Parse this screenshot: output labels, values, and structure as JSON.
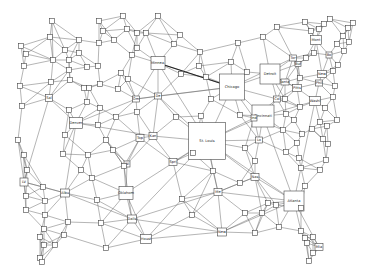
{
  "diagram": {
    "type": "network-graph",
    "labeled_nodes": [
      {
        "id": "stlouis",
        "label": "St. Louis",
        "x": 207,
        "y": 141,
        "w": 37,
        "h": 37
      },
      {
        "id": "chicago",
        "label": "Chicago",
        "x": 232,
        "y": 87,
        "w": 25,
        "h": 26
      },
      {
        "id": "detroit",
        "label": "Detroit",
        "x": 270,
        "y": 74,
        "w": 20,
        "h": 20
      },
      {
        "id": "cincinnati",
        "label": "Cincinnati",
        "x": 263,
        "y": 116,
        "w": 22,
        "h": 22
      },
      {
        "id": "atlanta",
        "label": "Atlanta",
        "x": 294,
        "y": 201,
        "w": 20,
        "h": 20
      },
      {
        "id": "minnea",
        "label": "Minnea.",
        "x": 158,
        "y": 63,
        "w": 14,
        "h": 13
      },
      {
        "id": "denver",
        "label": "Denver",
        "x": 76,
        "y": 123,
        "w": 13,
        "h": 11
      },
      {
        "id": "oklahom",
        "label": "Oklahom",
        "x": 126,
        "y": 193,
        "w": 14,
        "h": 13
      },
      {
        "id": "dallas",
        "label": "Dalls",
        "x": 132,
        "y": 219,
        "w": 9,
        "h": 8
      },
      {
        "id": "houst",
        "label": "Houst",
        "x": 146,
        "y": 239,
        "w": 11,
        "h": 9
      },
      {
        "id": "albu",
        "label": "Albu",
        "x": 65,
        "y": 193,
        "w": 9,
        "h": 8
      },
      {
        "id": "lv",
        "label": "LV",
        "x": 24,
        "y": 182,
        "w": 8,
        "h": 8
      },
      {
        "id": "sal",
        "label": "Sal",
        "x": 49,
        "y": 98,
        "w": 7,
        "h": 7
      },
      {
        "id": "omaha",
        "label": "Om",
        "x": 136,
        "y": 99,
        "w": 7,
        "h": 6
      },
      {
        "id": "desm",
        "label": "De",
        "x": 158,
        "y": 96,
        "w": 7,
        "h": 6
      },
      {
        "id": "topeka",
        "label": "Top",
        "x": 140,
        "y": 138,
        "w": 8,
        "h": 7
      },
      {
        "id": "kansas",
        "label": "Kan",
        "x": 153,
        "y": 136,
        "w": 8,
        "h": 7
      },
      {
        "id": "wichita",
        "label": "Wi",
        "x": 127,
        "y": 164,
        "w": 6,
        "h": 6
      },
      {
        "id": "spring",
        "label": "Spri",
        "x": 173,
        "y": 162,
        "w": 8,
        "h": 7
      },
      {
        "id": "mem",
        "label": "Me",
        "x": 218,
        "y": 192,
        "w": 8,
        "h": 7
      },
      {
        "id": "new_orl",
        "label": "New",
        "x": 222,
        "y": 232,
        "w": 9,
        "h": 8
      },
      {
        "id": "nash",
        "label": "Nas",
        "x": 255,
        "y": 177,
        "w": 8,
        "h": 7
      },
      {
        "id": "lou",
        "label": "Lo",
        "x": 259,
        "y": 140,
        "w": 7,
        "h": 6
      },
      {
        "id": "ind",
        "label": "Ind",
        "x": 254,
        "y": 118,
        "w": 6,
        "h": 6
      },
      {
        "id": "col",
        "label": "Col",
        "x": 277,
        "y": 99,
        "w": 7,
        "h": 6
      },
      {
        "id": "pitts",
        "label": "Pitts",
        "x": 297,
        "y": 88,
        "w": 9,
        "h": 7
      },
      {
        "id": "phila",
        "label": "Phil",
        "x": 319,
        "y": 83,
        "w": 7,
        "h": 6
      },
      {
        "id": "newyork",
        "label": "New",
        "x": 322,
        "y": 74,
        "w": 9,
        "h": 7
      },
      {
        "id": "wash",
        "label": "Washi",
        "x": 315,
        "y": 101,
        "w": 11,
        "h": 9
      },
      {
        "id": "toronto",
        "label": "Tor",
        "x": 293,
        "y": 58,
        "w": 7,
        "h": 6
      },
      {
        "id": "buff",
        "label": "Buf",
        "x": 298,
        "y": 64,
        "w": 6,
        "h": 5
      },
      {
        "id": "montreal",
        "label": "Mont",
        "x": 316,
        "y": 40,
        "w": 11,
        "h": 9
      },
      {
        "id": "boston",
        "label": "Bo",
        "x": 329,
        "y": 55,
        "w": 6,
        "h": 6
      },
      {
        "id": "atlanta_n",
        "label": "lanta",
        "x": 285,
        "y": 82,
        "w": 8,
        "h": 6
      },
      {
        "id": "miami",
        "label": "Mia",
        "x": 319,
        "y": 247,
        "w": 8,
        "h": 7
      }
    ],
    "unlabeled_node_count": 120
  }
}
